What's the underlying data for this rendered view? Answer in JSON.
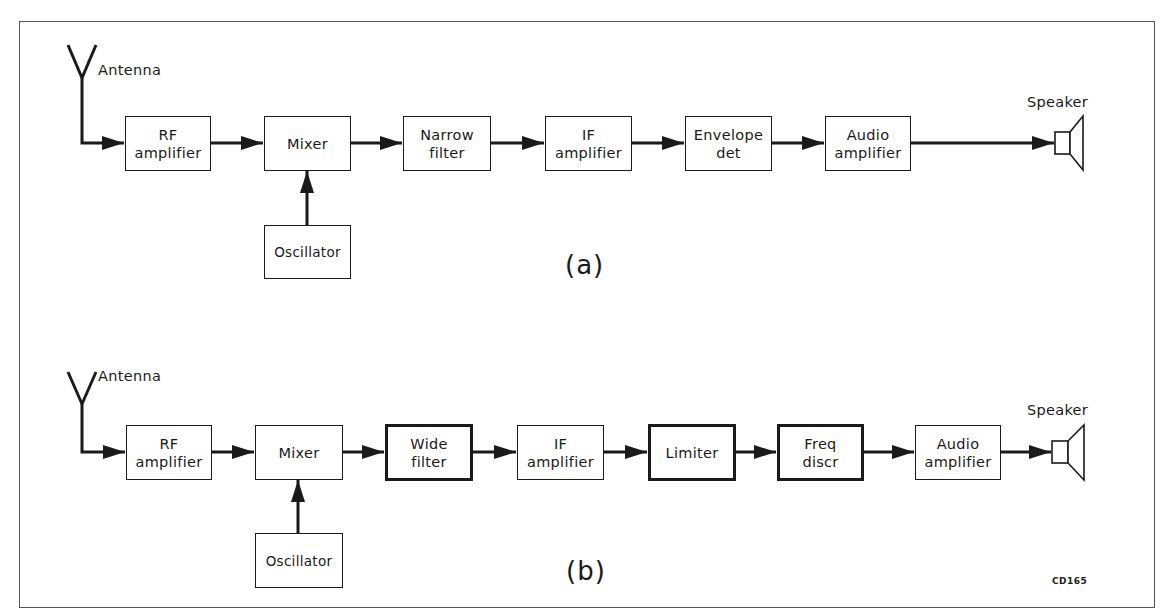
{
  "figure": {
    "code": "CD165",
    "panels": [
      {
        "id": "a",
        "label": "(a)",
        "antenna_label": "Antenna",
        "speaker_label": "Speaker",
        "oscillator": {
          "label": "Oscillator",
          "feeds": "Mixer"
        },
        "chain": [
          {
            "line1": "RF",
            "line2": "amplifier",
            "bold": false
          },
          {
            "line1": "Mixer",
            "line2": "",
            "bold": false
          },
          {
            "line1": "Narrow",
            "line2": "filter",
            "bold": false
          },
          {
            "line1": "IF",
            "line2": "amplifier",
            "bold": false
          },
          {
            "line1": "Envelope",
            "line2": "det",
            "bold": false
          },
          {
            "line1": "Audio",
            "line2": "amplifier",
            "bold": false
          }
        ]
      },
      {
        "id": "b",
        "label": "(b)",
        "antenna_label": "Antenna",
        "speaker_label": "Speaker",
        "oscillator": {
          "label": "Oscillator",
          "feeds": "Mixer"
        },
        "chain": [
          {
            "line1": "RF",
            "line2": "amplifier",
            "bold": false
          },
          {
            "line1": "Mixer",
            "line2": "",
            "bold": false
          },
          {
            "line1": "Wide",
            "line2": "filter",
            "bold": true
          },
          {
            "line1": "IF",
            "line2": "amplifier",
            "bold": false
          },
          {
            "line1": "Limiter",
            "line2": "",
            "bold": true
          },
          {
            "line1": "Freq",
            "line2": "discr",
            "bold": true
          },
          {
            "line1": "Audio",
            "line2": "amplifier",
            "bold": false
          }
        ]
      }
    ]
  },
  "colors": {
    "line": "#1a1a1a",
    "frame": "#555555",
    "background": "#ffffff"
  }
}
